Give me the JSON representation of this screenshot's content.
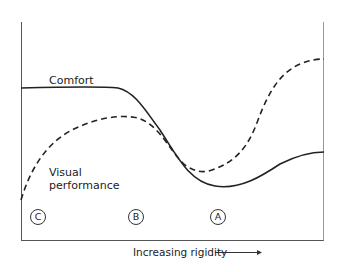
{
  "diagram": {
    "x_axis_label": "Increasing rigidity",
    "x_axis_arrow": "arrow-right",
    "curves": [
      {
        "name": "Comfort",
        "style": "solid"
      },
      {
        "name": "Visual performance",
        "style": "dashed"
      }
    ],
    "labels": {
      "comfort": "Comfort",
      "visual_line1": "Visual",
      "visual_line2": "performance"
    },
    "markers": [
      "C",
      "B",
      "A"
    ],
    "colors": {
      "line": "#222222",
      "axis": "#555555",
      "background": "#ffffff"
    }
  }
}
